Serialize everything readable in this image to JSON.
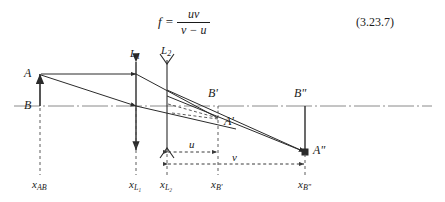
{
  "equation": {
    "lhs": "f",
    "equals": "=",
    "numerator": "uv",
    "denominator": "v − u",
    "number": "(3.23.7)"
  },
  "diagram": {
    "type": "optical-ray-diagram",
    "colors": {
      "stroke": "#2b2b2b",
      "axis": "#8a8a8a",
      "dashed": "#4a4a4a",
      "background": "#ffffff"
    },
    "points": [
      {
        "id": "A",
        "label": "A",
        "x": 40,
        "y": 74
      },
      {
        "id": "B",
        "label": "B",
        "x": 40,
        "y": 106
      },
      {
        "id": "Bp",
        "label": "B'",
        "x": 218,
        "y": 100
      },
      {
        "id": "Ap",
        "label": "A'",
        "x": 218,
        "y": 118
      },
      {
        "id": "Bpp",
        "label": "B\"",
        "x": 305,
        "y": 100
      },
      {
        "id": "App",
        "label": "A\"",
        "x": 305,
        "y": 152
      }
    ],
    "lenses": [
      {
        "id": "L1",
        "label": "L",
        "sub": "1",
        "x": 136,
        "type": "converging"
      },
      {
        "id": "L2",
        "label": "L",
        "sub": "2",
        "x": 167,
        "type": "diverging"
      }
    ],
    "dimensions": [
      {
        "id": "u",
        "label": "u",
        "from_x": 167,
        "to_x": 218,
        "y": 152
      },
      {
        "id": "v",
        "label": "v",
        "from_x": 167,
        "to_x": 305,
        "y": 164
      }
    ],
    "axis_labels": [
      {
        "id": "x_AB",
        "base": "x",
        "sub": "AB",
        "x": 40
      },
      {
        "id": "x_L1",
        "base": "x",
        "sub": "L₁",
        "x": 136
      },
      {
        "id": "x_L2",
        "base": "x",
        "sub": "L₂",
        "x": 167
      },
      {
        "id": "x_Bp",
        "base": "x",
        "sub": "B'",
        "x": 218
      },
      {
        "id": "x_Bpp",
        "base": "x",
        "sub": "B\"",
        "x": 305
      }
    ],
    "optical_axis": {
      "y": 106,
      "from_x": 14,
      "to_x": 432
    }
  }
}
